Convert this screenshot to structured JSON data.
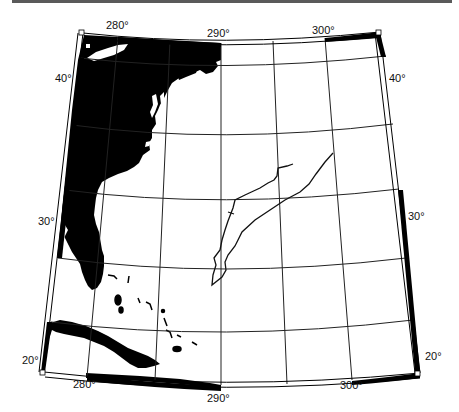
{
  "map": {
    "projection": "conic",
    "region": "Western North Atlantic",
    "longitude_labels_top": [
      "280°",
      "290°",
      "300°"
    ],
    "longitude_labels_bottom": [
      "280°",
      "290°",
      "300°"
    ],
    "latitude_labels_left": [
      "40°",
      "30°",
      "20°"
    ],
    "latitude_labels_right": [
      "40°",
      "30°",
      "20°"
    ],
    "graticule": {
      "longitudes": [
        275,
        280,
        285,
        290,
        295,
        300,
        305
      ],
      "latitudes": [
        20,
        25,
        30,
        35,
        40,
        45
      ]
    },
    "colors": {
      "land": "#000000",
      "water": "#ffffff",
      "grid": "#222222",
      "frame": "#000000"
    },
    "features": [
      "US East Coast landmass",
      "Florida peninsula",
      "Cuba",
      "Bahamas islands",
      "ship track line"
    ]
  }
}
